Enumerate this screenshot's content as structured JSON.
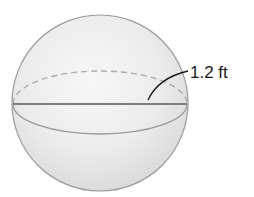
{
  "figure": {
    "shape": "sphere",
    "measurement": {
      "label": "1.2 ft",
      "refers_to": "radius"
    },
    "colors": {
      "background": "#ffffff",
      "sphere_fill_light": "#f4f4f4",
      "sphere_fill_dark": "#d6d6d6",
      "outline": "#9a9a9a",
      "diameter_line": "#7d7d7d",
      "dashed_arc": "#a8a8a8",
      "leader_line": "#1a1a1a"
    }
  }
}
